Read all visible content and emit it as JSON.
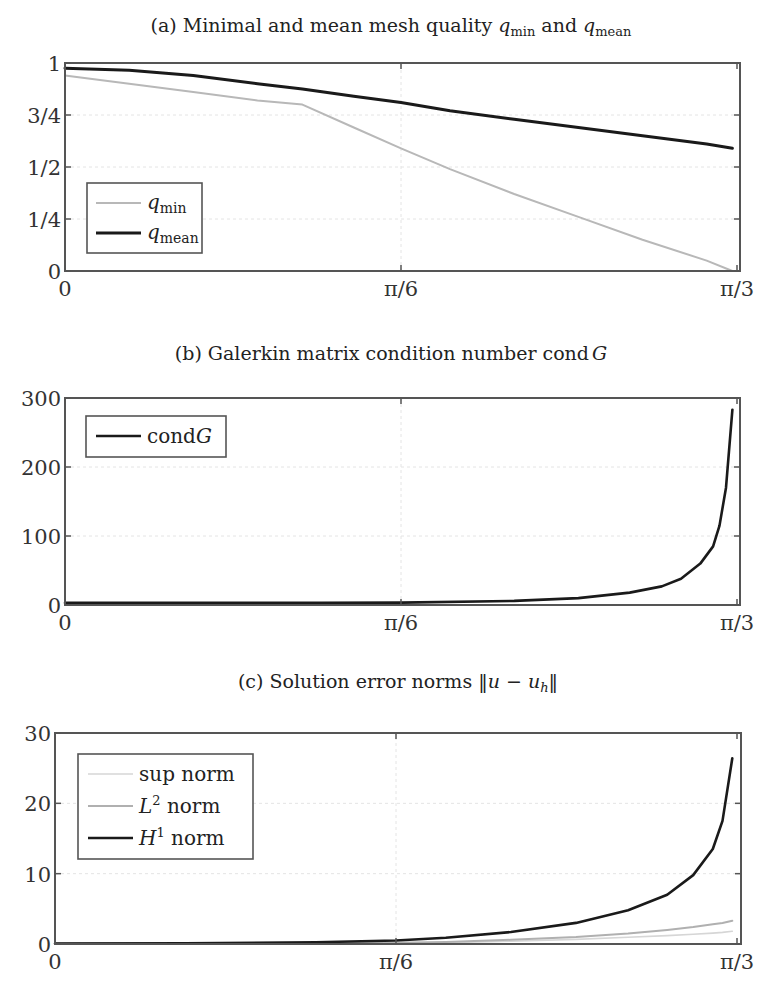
{
  "chart_data": [
    {
      "type": "line",
      "title": "(a) Minimal and mean mesh quality q_min and q_mean",
      "title_parts": {
        "prefix": "(a) Minimal and mean mesh quality ",
        "q1": "q",
        "q1_sub": "min",
        "mid": " and ",
        "q2": "q",
        "q2_sub": "mean"
      },
      "xlabel": "",
      "ylabel": "",
      "xlim": [
        0,
        1.0472
      ],
      "ylim": [
        0,
        1
      ],
      "xticks": [
        0,
        0.5236,
        1.0472
      ],
      "xtick_labels": [
        "0",
        "π/6",
        "π/3"
      ],
      "yticks": [
        0,
        0.25,
        0.5,
        0.75,
        1
      ],
      "ytick_labels": [
        "0",
        "1/4",
        "1/2",
        "3/4",
        "1"
      ],
      "grid": true,
      "legend_position": "lower left",
      "x": [
        0,
        0.1,
        0.2,
        0.3,
        0.37,
        0.45,
        0.5236,
        0.6,
        0.7,
        0.8,
        0.9,
        1.0,
        1.04
      ],
      "series": [
        {
          "name": "q_min",
          "label": "q",
          "sub": "min",
          "color": "#b8b8b8",
          "width": 2,
          "values": [
            0.94,
            0.9,
            0.86,
            0.82,
            0.8,
            0.69,
            0.59,
            0.49,
            0.37,
            0.26,
            0.15,
            0.05,
            0.0
          ]
        },
        {
          "name": "q_mean",
          "label": "q",
          "sub": "mean",
          "color": "#1a1a1a",
          "width": 3,
          "values": [
            0.975,
            0.965,
            0.94,
            0.9,
            0.875,
            0.84,
            0.81,
            0.77,
            0.73,
            0.69,
            0.65,
            0.61,
            0.59
          ]
        }
      ]
    },
    {
      "type": "line",
      "title": "(b) Galerkin matrix condition number cond G",
      "title_parts": {
        "prefix": "(b) Galerkin matrix condition number cond",
        "var": "G"
      },
      "xlabel": "",
      "ylabel": "",
      "xlim": [
        0,
        1.0472
      ],
      "ylim": [
        0,
        300
      ],
      "xticks": [
        0,
        0.5236,
        1.0472
      ],
      "xtick_labels": [
        "0",
        "π/6",
        "π/3"
      ],
      "yticks": [
        0,
        100,
        200,
        300
      ],
      "ytick_labels": [
        "0",
        "100",
        "200",
        "300"
      ],
      "grid": true,
      "legend_position": "upper left",
      "x": [
        0,
        0.2,
        0.4,
        0.5236,
        0.7,
        0.8,
        0.88,
        0.93,
        0.96,
        0.99,
        1.01,
        1.02,
        1.03,
        1.04
      ],
      "series": [
        {
          "name": "condG",
          "label": "cond",
          "label_var": "G",
          "color": "#1a1a1a",
          "width": 2.6,
          "values": [
            3,
            3,
            3,
            3.5,
            6,
            10,
            18,
            27,
            38,
            60,
            85,
            115,
            170,
            283
          ]
        }
      ]
    },
    {
      "type": "line",
      "title": "(c) Solution error norms ||u − u_h||",
      "title_parts": {
        "prefix": "(c) Solution error norms ",
        "expr": "‖u − u",
        "sub": "h",
        "suffix": "‖"
      },
      "xlabel": "",
      "ylabel": "",
      "xlim": [
        0,
        1.0472
      ],
      "ylim": [
        0,
        30
      ],
      "xticks": [
        0,
        0.5236,
        1.0472
      ],
      "xtick_labels": [
        "0",
        "π/6",
        "π/3"
      ],
      "yticks": [
        0,
        10,
        20,
        30
      ],
      "ytick_labels": [
        "0",
        "10",
        "20",
        "30"
      ],
      "grid": true,
      "legend_position": "upper left",
      "x": [
        0,
        0.2,
        0.4,
        0.5236,
        0.6,
        0.7,
        0.8,
        0.88,
        0.94,
        0.98,
        1.01,
        1.025,
        1.04
      ],
      "series": [
        {
          "name": "sup norm",
          "label": "sup norm",
          "color": "#d6d6d6",
          "width": 1.6,
          "values": [
            0.05,
            0.05,
            0.08,
            0.12,
            0.2,
            0.4,
            0.65,
            0.95,
            1.2,
            1.4,
            1.55,
            1.65,
            1.8
          ]
        },
        {
          "name": "L2 norm",
          "label": "L",
          "sup": "2",
          "label_rest": " norm",
          "color": "#b0b0b0",
          "width": 2,
          "values": [
            0.05,
            0.06,
            0.1,
            0.18,
            0.3,
            0.6,
            1.0,
            1.5,
            2.0,
            2.4,
            2.8,
            3.0,
            3.3
          ]
        },
        {
          "name": "H1 norm",
          "label": "H",
          "sup": "1",
          "label_rest": " norm",
          "color": "#1a1a1a",
          "width": 2.6,
          "values": [
            0.05,
            0.1,
            0.25,
            0.5,
            0.9,
            1.7,
            3.0,
            4.8,
            7.0,
            9.8,
            13.5,
            17.5,
            26.4
          ]
        }
      ]
    }
  ]
}
